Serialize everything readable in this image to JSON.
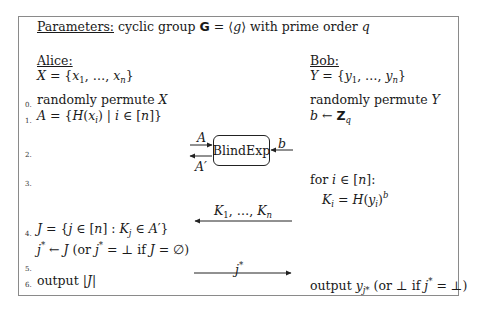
{
  "parameters": {
    "label": "Parameters:",
    "text": "cyclic group 𝔾 = ⟨g⟩ with prime order q"
  },
  "alice": {
    "name": "Alice:",
    "set": "X = {x₁, …, xₙ}"
  },
  "bob": {
    "name": "Bob:",
    "set": "Y = {y₁, …, yₙ}"
  },
  "steps": [
    {
      "num": "0.",
      "alice": "randomly permute X",
      "bob": "randomly permute Y"
    },
    {
      "num": "1.",
      "alice": "A = {H(xᵢ) | i ∈ [n]}",
      "bob": "b ← ℤ_q"
    },
    {
      "num": "2.",
      "alice": "",
      "bob": ""
    },
    {
      "num": "3.",
      "alice": "",
      "bob_line1": "for i ∈ [n]:",
      "bob_line2": "Kᵢ = H(yᵢ)^b"
    },
    {
      "num": "4.",
      "alice_line1": "J = {j ∈ [n] : K_j ∈ A′}",
      "alice_line2": "j* ← J (or j* = ⊥ if J = ∅)"
    },
    {
      "num": "5.",
      "alice": "",
      "bob": ""
    },
    {
      "num": "6.",
      "alice": "output |J|",
      "bob": "output y_{j*} (or ⊥ if j* = ⊥)"
    }
  ],
  "functionality": {
    "name": "BlindExp",
    "input_left": "A",
    "output_left": "A′",
    "input_right": "b"
  },
  "messages": [
    {
      "label": "K₁, …, Kₙ",
      "direction": "bob-to-alice"
    },
    {
      "label": "j*",
      "direction": "alice-to-bob"
    }
  ]
}
